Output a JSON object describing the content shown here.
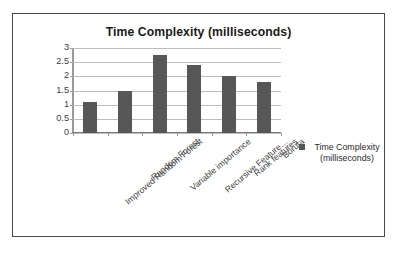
{
  "chart_data": {
    "type": "bar",
    "title": "Time Complexity (milliseconds)",
    "xlabel": "",
    "ylabel": "",
    "ylim": [
      0,
      3
    ],
    "yticks": [
      "0",
      "0.5",
      "1",
      "1.5",
      "2",
      "2.5",
      "3"
    ],
    "ytick_values": [
      0,
      0.5,
      1,
      1.5,
      2,
      2.5,
      3
    ],
    "grid": true,
    "legend_position": "right",
    "categories": [
      "Improved Random Forest",
      "Random Forest",
      "Variable importance",
      "Recursive Feature…",
      "Rank features",
      "Boruta"
    ],
    "series": [
      {
        "name": "Time Complexity (milliseconds)",
        "values": [
          1.1,
          1.5,
          2.75,
          2.4,
          2.0,
          1.8
        ],
        "color": "#575757"
      }
    ]
  },
  "legend": {
    "label": "Time Complexity (milliseconds)",
    "swatch_name": "series-color-swatch"
  }
}
